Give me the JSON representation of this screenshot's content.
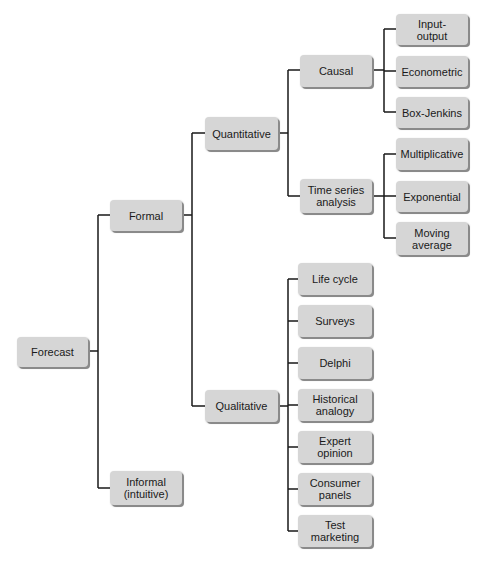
{
  "diagram": {
    "type": "tree",
    "root": {
      "label": "Forecast",
      "children": [
        {
          "label": "Formal",
          "children": [
            {
              "label": "Quantitative",
              "children": [
                {
                  "label": "Causal",
                  "children": [
                    {
                      "label": "Input-\noutput"
                    },
                    {
                      "label": "Econometric"
                    },
                    {
                      "label": "Box-Jenkins"
                    }
                  ]
                },
                {
                  "label": "Time series\nanalysis",
                  "children": [
                    {
                      "label": "Multiplicative"
                    },
                    {
                      "label": "Exponential"
                    },
                    {
                      "label": "Moving\naverage"
                    }
                  ]
                }
              ]
            },
            {
              "label": "Qualitative",
              "children": [
                {
                  "label": "Life cycle"
                },
                {
                  "label": "Surveys"
                },
                {
                  "label": "Delphi"
                },
                {
                  "label": "Historical\nanalogy"
                },
                {
                  "label": "Expert\nopinion"
                },
                {
                  "label": "Consumer\npanels"
                },
                {
                  "label": "Test\nmarketing"
                }
              ]
            }
          ]
        },
        {
          "label": "Informal\n(intuitive)"
        }
      ]
    }
  },
  "nodes": {
    "forecast": "Forecast",
    "formal": "Formal",
    "informal": "Informal\n(intuitive)",
    "quantitative": "Quantitative",
    "qualitative": "Qualitative",
    "causal": "Causal",
    "time_series": "Time series\nanalysis",
    "input_output": "Input-\noutput",
    "econometric": "Econometric",
    "box_jenkins": "Box-Jenkins",
    "multiplicative": "Multiplicative",
    "exponential": "Exponential",
    "moving_average": "Moving\naverage",
    "life_cycle": "Life cycle",
    "surveys": "Surveys",
    "delphi": "Delphi",
    "historical_analogy": "Historical\nanalogy",
    "expert_opinion": "Expert\nopinion",
    "consumer_panels": "Consumer\npanels",
    "test_marketing": "Test\nmarketing"
  },
  "colors": {
    "node_fill": "#d6d6d6",
    "node_shadow": "#8a8a8a",
    "connector": "#1a1a1a",
    "text": "#1a1a1a"
  }
}
